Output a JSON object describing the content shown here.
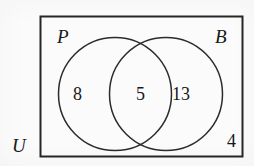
{
  "diagram": {
    "type": "venn-2-set",
    "title": "",
    "universe": {
      "label": "U",
      "label_name": "universal-set-label",
      "outside_count": "4"
    },
    "sets": [
      {
        "id": "P",
        "label": "P",
        "only_count": "8"
      },
      {
        "id": "B",
        "label": "B",
        "only_count": "13"
      }
    ],
    "intersection": {
      "label": "",
      "count": "5"
    },
    "colors": {
      "stroke": "#2b2b2b",
      "rect_stroke": "#262626",
      "text": "#171717",
      "background": "#fbfbfb"
    },
    "geometry": {
      "rect": {
        "x": 40,
        "y": 16,
        "width": 203,
        "height": 141
      },
      "circle_left": {
        "cx": 115,
        "cy": 94,
        "r": 57
      },
      "circle_right": {
        "cx": 166,
        "cy": 94,
        "r": 57
      }
    }
  },
  "chart_data": {
    "type": "venn",
    "sets": [
      "P",
      "B"
    ],
    "regions": [
      {
        "region": "P only",
        "label": "8",
        "value": 8
      },
      {
        "region": "P and B",
        "label": "5",
        "value": 5
      },
      {
        "region": "B only",
        "label": "13",
        "value": 13
      },
      {
        "region": "outside P and B (U only)",
        "label": "4",
        "value": 4
      }
    ],
    "totals": {
      "P": 13,
      "B": 18,
      "universe": 30
    },
    "legend": [
      "P",
      "B",
      "U"
    ],
    "xlabel": "",
    "ylabel": ""
  }
}
